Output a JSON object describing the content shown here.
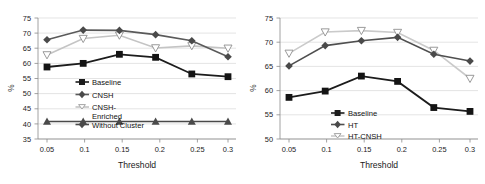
{
  "figure": {
    "background": "#ffffff",
    "panels": 2
  },
  "chart_data": [
    {
      "type": "line",
      "title": "",
      "xlabel": "Threshold",
      "ylabel": "%",
      "x": [
        0.05,
        0.1,
        0.15,
        0.2,
        0.25,
        0.3
      ],
      "categories": [
        "0.05",
        "0.1",
        "0.15",
        "0.2",
        "0.25",
        "0.3"
      ],
      "xlim": [
        0.05,
        0.3
      ],
      "ylim": [
        35,
        75
      ],
      "yticks": [
        35,
        40,
        45,
        50,
        55,
        60,
        65,
        70,
        75
      ],
      "grid": true,
      "legend_position": "center-left-inside",
      "series": [
        {
          "name": "Baseline",
          "marker": "filled-square",
          "color": "#1c1c1c",
          "values": [
            58.8,
            60.0,
            63.0,
            62.0,
            56.5,
            55.6
          ]
        },
        {
          "name": "CNSH",
          "marker": "filled-diamond",
          "color": "#5a5a5a",
          "values": [
            67.8,
            71.0,
            70.9,
            69.5,
            67.5,
            62.2
          ]
        },
        {
          "name": "CNSH-Enriched",
          "marker": "open-triangle-down",
          "color": "#c4c4c4",
          "values": [
            62.8,
            68.2,
            69.3,
            65.1,
            65.8,
            65.0
          ]
        },
        {
          "name": "Without Cluster",
          "marker": "filled-triangle-up",
          "color": "#4a4a4a",
          "values": [
            40.8,
            40.8,
            40.8,
            40.8,
            40.8,
            40.8
          ]
        }
      ]
    },
    {
      "type": "line",
      "title": "",
      "xlabel": "Threshold",
      "ylabel": "%",
      "x": [
        0.05,
        0.1,
        0.15,
        0.2,
        0.25,
        0.3
      ],
      "categories": [
        "0.05",
        "0.1",
        "0.15",
        "0.2",
        "0.25",
        "0.3"
      ],
      "xlim": [
        0.05,
        0.3
      ],
      "ylim": [
        50,
        75
      ],
      "yticks": [
        50,
        55,
        60,
        65,
        70,
        75
      ],
      "grid": true,
      "legend_position": "center-inside",
      "series": [
        {
          "name": "Baseline",
          "marker": "filled-square",
          "color": "#1c1c1c",
          "values": [
            58.6,
            59.9,
            63.0,
            61.9,
            56.5,
            55.7
          ]
        },
        {
          "name": "HT",
          "marker": "filled-diamond",
          "color": "#4f4f4f",
          "values": [
            65.1,
            69.3,
            70.3,
            71.0,
            67.5,
            66.1
          ]
        },
        {
          "name": "HT-CNSH",
          "marker": "open-triangle-down",
          "color": "#cacaca",
          "values": [
            67.7,
            72.1,
            72.4,
            72.0,
            68.3,
            62.5
          ]
        }
      ]
    }
  ],
  "left_panel": {
    "ylabel": "%",
    "xlabel": "Threshold",
    "yticks": [
      "75",
      "70",
      "65",
      "60",
      "55",
      "50",
      "45",
      "40",
      "35"
    ],
    "xticks": [
      "0.05",
      "0.1",
      "0.15",
      "0.2",
      "0.25",
      "0.3"
    ],
    "legend": [
      {
        "label": "Baseline"
      },
      {
        "label": "CNSH"
      },
      {
        "label": "CNSH-"
      },
      {
        "label": "Enriched"
      },
      {
        "label": "Without Cluster"
      }
    ]
  },
  "right_panel": {
    "ylabel": "%",
    "xlabel": "Threshold",
    "yticks": [
      "75",
      "70",
      "65",
      "60",
      "55",
      "50"
    ],
    "xticks": [
      "0.05",
      "0.1",
      "0.15",
      "0.2",
      "0.25",
      "0.3"
    ],
    "legend": [
      {
        "label": "Baseline"
      },
      {
        "label": "HT"
      },
      {
        "label": "HT-CNSH"
      }
    ]
  }
}
